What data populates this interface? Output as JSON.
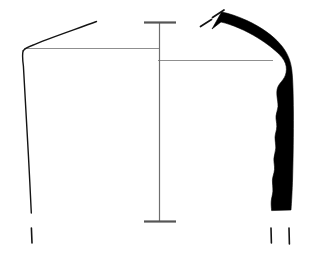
{
  "figure": {
    "kind": "archaeological-vessel-profile-drawing",
    "background_color": "#ffffff",
    "width": 313,
    "height": 254,
    "header_label": "",
    "ink_color": "#111111",
    "section_fill_color": "#000000",
    "rim_line_color": "#8c8c8c",
    "scale_bar_color": "#7a7a7a"
  },
  "left_profile": {
    "name": "exterior-profile-outline",
    "description": "Thin outline of the vessel exterior: everted rim rising to the right, sharp shoulder carination, then a long slightly convex wall descending to the base.",
    "stroke_color": "#141414",
    "stroke_width": 1.3,
    "rim_tip": {
      "x": 96,
      "y": 22
    },
    "carination": {
      "x": 23,
      "y": 49
    },
    "wall_bottom": {
      "x": 31,
      "y": 213
    },
    "base_tick": {
      "x": 31,
      "y": 228,
      "length": 15
    }
  },
  "right_section": {
    "name": "filled-wall-cross-section",
    "description": "Solid black L-shaped cross-section of the vessel wall: thick everted rim sloping down-right, angular shoulder, then a vertical wall with an irregular wavy inner face running to the base.",
    "fill_color": "#000000",
    "rim_break_start": {
      "x": 212,
      "y": 27
    },
    "shoulder": {
      "x": 283,
      "y": 58
    },
    "wall_bottom": {
      "x": 272,
      "y": 210
    },
    "base_ticks": [
      {
        "x": 271,
        "y": 228,
        "length": 16
      },
      {
        "x": 289,
        "y": 228,
        "length": 16
      }
    ]
  },
  "break_marks": {
    "name": "broken-edge-hatching",
    "description": "Two short diagonal dashes indicating the broken/incomplete rim edge.",
    "count": 2,
    "stroke_color": "#111111",
    "marks": [
      {
        "x1": 201,
        "y1": 26,
        "x2": 212,
        "y2": 19
      },
      {
        "x1": 212,
        "y1": 17,
        "x2": 223,
        "y2": 10
      }
    ]
  },
  "rim_lines": {
    "name": "rim-reference-lines",
    "left": {
      "y": 48,
      "x_start": 24,
      "x_end": 160,
      "color": "#8f8f8f"
    },
    "right": {
      "y": 60,
      "x_start": 158,
      "x_end": 272,
      "color": "#8f8f8f"
    }
  },
  "scale_bar": {
    "name": "vertical-axis-scale-bar",
    "description": "Vertical measurement axis with horizontal serif caps at the top and bottom.",
    "x": 159,
    "y_top": 22,
    "y_bottom": 222,
    "cap_width": 32,
    "stroke_color": "#6e6e6e",
    "cap_color": "#555555",
    "top_label": "",
    "bottom_label": ""
  }
}
